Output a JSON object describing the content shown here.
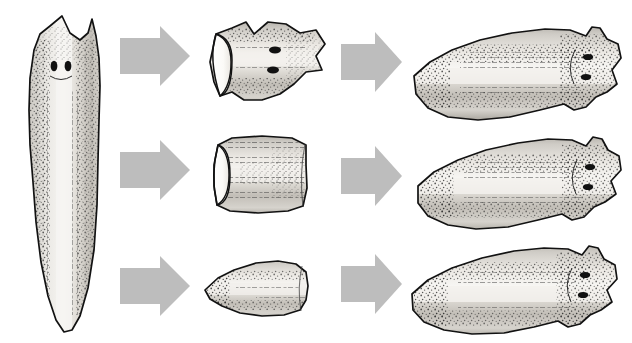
{
  "figure": {
    "background_color": "#ffffff",
    "arrow_color": "#bdbdbd",
    "outline_color": "#1a1a1a",
    "body_fill_light": "#f2f0ec",
    "body_fill_mid": "#c9c6c0",
    "body_fill_dark": "#9a968f",
    "eye_color": "#111111",
    "cut_surface_color": "#fdfdfb"
  },
  "columns": [
    {
      "name": "intact-worm",
      "label": "Intact planarian"
    },
    {
      "name": "fragments",
      "label": "Cut fragments"
    },
    {
      "name": "regenerated",
      "label": "Regenerated planarians"
    }
  ],
  "rows": [
    {
      "id": "row-head",
      "fragment_name": "head-fragment",
      "fragment_label": "Anterior (head) piece",
      "result_name": "regenerated-worm-from-head",
      "result_label": "Complete planarian",
      "fragment_has_eyes": true,
      "fragment_eye_count": 2,
      "result_eye_count": 2
    },
    {
      "id": "row-middle",
      "fragment_name": "middle-fragment",
      "fragment_label": "Middle (trunk) piece",
      "result_name": "regenerated-worm-from-middle",
      "result_label": "Complete planarian",
      "fragment_has_eyes": false,
      "fragment_eye_count": 0,
      "result_eye_count": 2
    },
    {
      "id": "row-tail",
      "fragment_name": "tail-fragment",
      "fragment_label": "Posterior (tail) piece",
      "result_name": "regenerated-worm-from-tail",
      "result_label": "Complete planarian",
      "fragment_has_eyes": false,
      "fragment_eye_count": 0,
      "result_eye_count": 2
    }
  ],
  "intact_worm": {
    "name": "intact-planarian",
    "label": "Whole planarian, dorsal view",
    "eye_count": 2,
    "head_position": "top",
    "tail_position": "bottom"
  },
  "arrows": [
    {
      "name": "arrow-cut-head",
      "row": "row-head",
      "column": 1
    },
    {
      "name": "arrow-cut-middle",
      "row": "row-middle",
      "column": 1
    },
    {
      "name": "arrow-cut-tail",
      "row": "row-tail",
      "column": 1
    },
    {
      "name": "arrow-regen-head",
      "row": "row-head",
      "column": 2
    },
    {
      "name": "arrow-regen-middle",
      "row": "row-middle",
      "column": 2
    },
    {
      "name": "arrow-regen-tail",
      "row": "row-tail",
      "column": 2
    }
  ]
}
